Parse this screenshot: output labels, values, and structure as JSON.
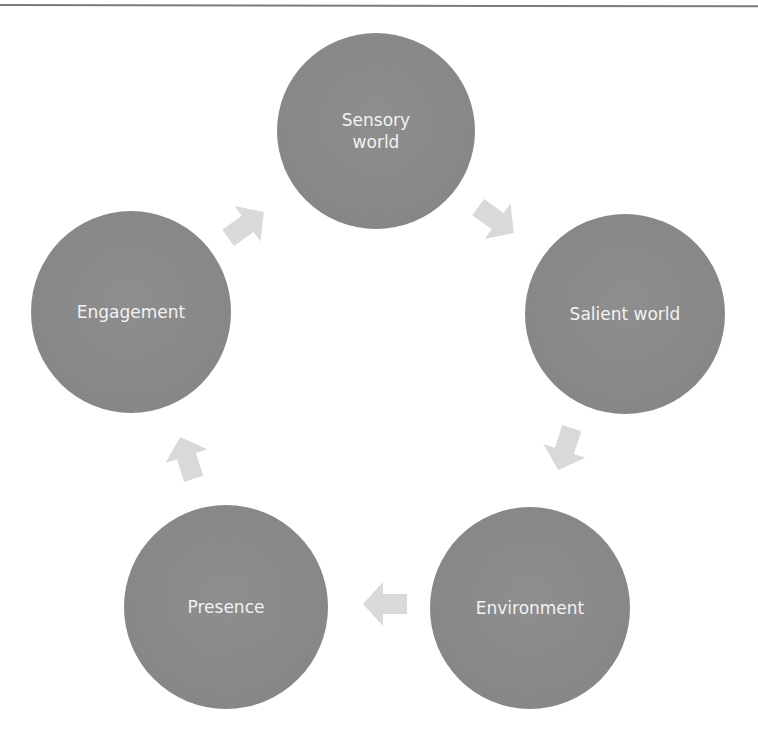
{
  "colors": {
    "node_fill": "#8a8a8a",
    "node_text": "#f2f2f2",
    "arrow_fill": "#d9d9d9",
    "rule": "#7a7a7a",
    "background": "#ffffff"
  },
  "diagram": {
    "type": "cycle",
    "nodes": [
      {
        "id": "sensory",
        "label": "Sensory\nworld"
      },
      {
        "id": "salient",
        "label": "Salient world"
      },
      {
        "id": "environment",
        "label": "Environment"
      },
      {
        "id": "presence",
        "label": "Presence"
      },
      {
        "id": "engagement",
        "label": "Engagement"
      }
    ],
    "edges": [
      {
        "from": "Sensory world",
        "to": "Salient world",
        "icon": "arrow-down-right-icon"
      },
      {
        "from": "Salient world",
        "to": "Environment",
        "icon": "arrow-down-left-icon"
      },
      {
        "from": "Environment",
        "to": "Presence",
        "icon": "arrow-left-icon"
      },
      {
        "from": "Presence",
        "to": "Engagement",
        "icon": "arrow-up-icon"
      },
      {
        "from": "Engagement",
        "to": "Sensory world",
        "icon": "arrow-up-right-icon"
      }
    ]
  }
}
